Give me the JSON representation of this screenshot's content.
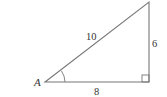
{
  "diagram": {
    "type": "right-triangle",
    "vertex_label": "A",
    "hypotenuse_label": "10",
    "opposite_label": "6",
    "adjacent_label": "8",
    "stroke_color": "#666666"
  }
}
